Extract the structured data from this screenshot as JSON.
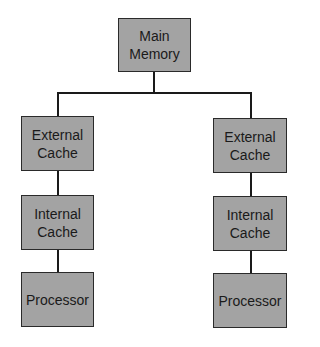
{
  "diagram": {
    "type": "memory-hierarchy",
    "nodes": {
      "main_memory": "Main\nMemory",
      "left": {
        "external_cache": "External\nCache",
        "internal_cache": "Internal\nCache",
        "processor": "Processor"
      },
      "right": {
        "external_cache": "External\nCache",
        "internal_cache": "Internal\nCache",
        "processor": "Processor"
      }
    },
    "colors": {
      "box_fill": "#a3a3a3",
      "box_border": "#2a2a2a",
      "line": "#1a1a1a",
      "background": "#ffffff"
    }
  }
}
